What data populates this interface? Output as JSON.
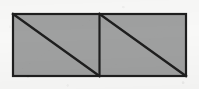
{
  "canvas": {
    "width": 199,
    "height": 89,
    "background_color": "#f8f8f7",
    "description": "Scanned black-and-white line drawing of a shaded rectangle split into two squares, each crossed by a diagonal."
  },
  "figure": {
    "title": "Rectangle divided into two squares with diagonals",
    "outline_color": "#1e1e1e",
    "fill_color": "#9fa0a0",
    "diagonal_color": "#1e1e1e",
    "divider_color": "#1e1e1e",
    "outline_width": 2.2,
    "diagonal_width": 2.4,
    "divider_width": 2.2,
    "bounds": {
      "x": 13,
      "y": 14,
      "width": 173,
      "height": 62
    },
    "divider_x": 99.5,
    "shapes": [
      {
        "name": "outer-rectangle",
        "type": "rectangle",
        "x": 13,
        "y": 14,
        "width": 173,
        "height": 62,
        "filled": true
      },
      {
        "name": "left-square",
        "type": "square-cell",
        "x": 13,
        "y": 14,
        "width": 86.5,
        "height": 62,
        "diagonal": "top-left-to-bottom-right"
      },
      {
        "name": "right-square",
        "type": "square-cell",
        "x": 99.5,
        "y": 14,
        "width": 86.5,
        "height": 62,
        "diagonal": "top-left-to-bottom-right"
      }
    ],
    "lines": [
      {
        "name": "vertical-divider",
        "x1": 99.5,
        "y1": 14,
        "x2": 99.5,
        "y2": 76
      },
      {
        "name": "left-diagonal",
        "x1": 13,
        "y1": 14,
        "x2": 99.5,
        "y2": 76
      },
      {
        "name": "right-diagonal",
        "x1": 99.5,
        "y1": 14,
        "x2": 186,
        "y2": 76
      }
    ],
    "region_count": 4,
    "region_labels": [
      "upper-left-triangle",
      "lower-left-triangle",
      "upper-right-triangle",
      "lower-right-triangle"
    ]
  }
}
